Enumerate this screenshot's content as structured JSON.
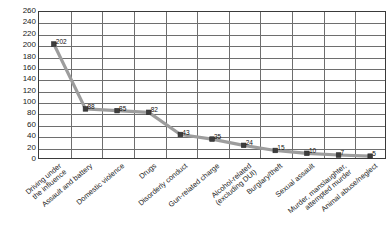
{
  "chart_data": {
    "type": "line",
    "title": "",
    "subtitle": "",
    "xlabel": "",
    "ylabel": "",
    "ylim": [
      0,
      260
    ],
    "ytick_step": 20,
    "grid": true,
    "legend": "none",
    "series_name": "Charges",
    "line_color": "#9d9d9d",
    "marker_color": "#3d3d3d",
    "categories": [
      "Driving under\nthe influence",
      "Assault and battery",
      "Domestic violence",
      "Drugs",
      "Disorderly conduct",
      "Gun-related charge",
      "Alcohol-related\n(excluding DUI)",
      "Burglary/theft",
      "Sexual assault",
      "Murder, manslaughter,\nattempted murder",
      "Animal abuse/neglect"
    ],
    "values": [
      202,
      88,
      85,
      82,
      43,
      35,
      24,
      15,
      10,
      7,
      5
    ],
    "point_labels": [
      "202",
      "88",
      "85",
      "82",
      "43",
      "35",
      "24",
      "15",
      "10",
      "7",
      "5"
    ],
    "ytick_labels": [
      "0",
      "20",
      "40",
      "60",
      "80",
      "100",
      "120",
      "140",
      "160",
      "180",
      "200",
      "220",
      "240",
      "260"
    ]
  }
}
